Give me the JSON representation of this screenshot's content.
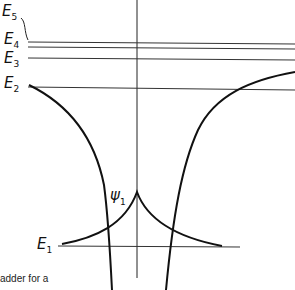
{
  "levels": [
    {
      "name": "E",
      "sub": "5",
      "y": 16
    },
    {
      "name": "E",
      "sub": "4",
      "y": 42
    },
    {
      "name": "E",
      "sub": "3",
      "y": 58
    },
    {
      "name": "E",
      "sub": "2",
      "y": 87
    },
    {
      "name": "E",
      "sub": "1",
      "y": 248
    }
  ],
  "wavefunction": {
    "name": "ψ",
    "sub": "1"
  },
  "caption_fragment": "adder for a",
  "colors": {
    "ink": "#111111",
    "background": "#ffffff"
  }
}
